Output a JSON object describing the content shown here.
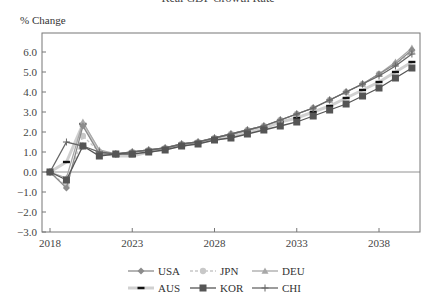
{
  "title": "Real GDP Growth Rate",
  "ylabel_text": "% Change",
  "chart_data": {
    "type": "line",
    "title": "Real GDP Growth Rate",
    "xlabel": "",
    "ylabel": "% Change",
    "xlim": [
      2018,
      2040.5
    ],
    "ylim": [
      -3.0,
      7.0
    ],
    "yticks": [
      "6.0",
      "5.0",
      "4.0",
      "3.0",
      "2.0",
      "1.0",
      "0.0",
      "-1.0",
      "-2.0",
      "-3.0"
    ],
    "xticks": [
      "2018",
      "2023",
      "2028",
      "2033",
      "2038"
    ],
    "grid": false,
    "legend_position": "bottom",
    "x": [
      2018,
      2019,
      2020,
      2021,
      2022,
      2023,
      2024,
      2025,
      2026,
      2027,
      2028,
      2029,
      2030,
      2031,
      2032,
      2033,
      2034,
      2035,
      2036,
      2037,
      2038,
      2039,
      2040
    ],
    "series": [
      {
        "name": "USA",
        "color": "#8c8c8c",
        "marker": "diamond",
        "values": [
          0.0,
          -0.8,
          2.3,
          0.9,
          0.9,
          1.0,
          1.1,
          1.2,
          1.4,
          1.5,
          1.7,
          1.9,
          2.1,
          2.3,
          2.6,
          2.9,
          3.2,
          3.6,
          4.0,
          4.4,
          4.9,
          5.4,
          6.1
        ]
      },
      {
        "name": "JPN",
        "color": "#c8c8c8",
        "marker": "circle",
        "dash": "3,2",
        "values": [
          0.0,
          -0.7,
          1.8,
          1.0,
          0.9,
          1.0,
          1.1,
          1.2,
          1.4,
          1.5,
          1.7,
          1.9,
          2.1,
          2.3,
          2.6,
          2.9,
          3.2,
          3.6,
          4.0,
          4.4,
          4.9,
          5.4,
          6.0
        ]
      },
      {
        "name": "DEU",
        "color": "#a8a8a8",
        "marker": "triangle",
        "values": [
          0.0,
          -0.3,
          2.5,
          1.1,
          0.9,
          1.0,
          1.1,
          1.2,
          1.4,
          1.5,
          1.7,
          1.9,
          2.1,
          2.3,
          2.6,
          2.9,
          3.2,
          3.6,
          4.0,
          4.4,
          4.9,
          5.5,
          6.2
        ]
      },
      {
        "name": "AUS",
        "color": "#d0d0d0",
        "marker": "dash",
        "values": [
          0.0,
          0.5,
          2.4,
          1.0,
          0.8,
          0.8,
          1.0,
          1.2,
          1.3,
          1.5,
          1.6,
          1.8,
          2.0,
          2.2,
          2.5,
          2.7,
          3.0,
          3.3,
          3.7,
          4.1,
          4.5,
          5.0,
          5.5
        ]
      },
      {
        "name": "KOR",
        "color": "#555555",
        "marker": "square",
        "values": [
          0.0,
          -0.4,
          1.3,
          0.8,
          0.9,
          0.9,
          1.0,
          1.1,
          1.3,
          1.4,
          1.6,
          1.7,
          1.9,
          2.1,
          2.3,
          2.5,
          2.8,
          3.1,
          3.4,
          3.8,
          4.2,
          4.7,
          5.2
        ]
      },
      {
        "name": "CHI",
        "color": "#666666",
        "marker": "cross",
        "values": [
          0.0,
          1.5,
          1.3,
          1.0,
          0.9,
          1.0,
          1.1,
          1.2,
          1.4,
          1.5,
          1.7,
          1.9,
          2.1,
          2.3,
          2.6,
          2.9,
          3.2,
          3.6,
          4.0,
          4.4,
          4.8,
          5.3,
          5.9
        ]
      }
    ]
  },
  "legend": {
    "row1": [
      "USA",
      "JPN",
      "DEU"
    ],
    "row2": [
      "AUS",
      "KOR",
      "CHI"
    ]
  }
}
